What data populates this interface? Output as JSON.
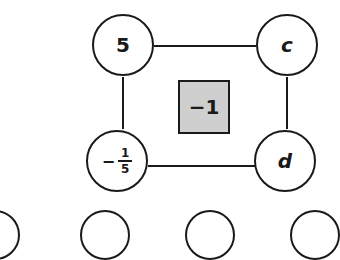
{
  "diagram": {
    "nodes": {
      "top_left": "5",
      "top_right": "c",
      "bottom_left": {
        "sign": "−",
        "numerator": "1",
        "denominator": "5"
      },
      "bottom_right": "d"
    },
    "center_value": "−1",
    "colors": {
      "line": "#1a1a1a",
      "center_fill": "#cfcfcf"
    },
    "bottom_row_partial_circles": 4
  }
}
